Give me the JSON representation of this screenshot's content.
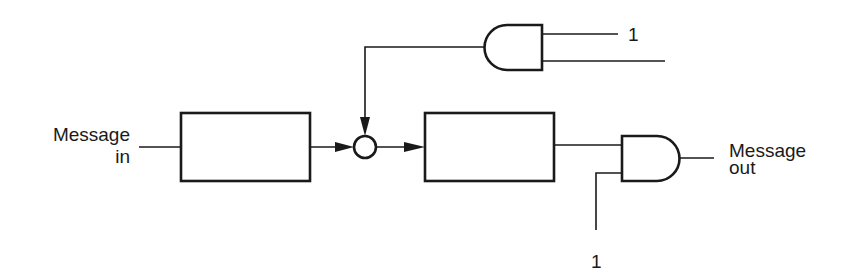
{
  "diagram": {
    "type": "logic-block-diagram",
    "labels": {
      "input_line1": "Message",
      "input_line2": "in",
      "output_line1": "Message",
      "output_line2": "out",
      "top_gate_input_constant": "1",
      "bottom_gate_input_constant": "1"
    },
    "nodes": [
      {
        "id": "block-1",
        "kind": "rectangle",
        "label": ""
      },
      {
        "id": "junction",
        "kind": "circle",
        "label": ""
      },
      {
        "id": "block-2",
        "kind": "rectangle",
        "label": ""
      },
      {
        "id": "and-gate-top",
        "kind": "and-gate",
        "orientation": "output-left"
      },
      {
        "id": "and-gate-output",
        "kind": "and-gate",
        "orientation": "output-right"
      }
    ],
    "edges": [
      {
        "from": "Message in",
        "to": "block-1"
      },
      {
        "from": "block-1",
        "to": "junction",
        "arrow": true
      },
      {
        "from": "junction",
        "to": "block-2",
        "arrow": true
      },
      {
        "from": "and-gate-top",
        "to": "junction",
        "arrow": true
      },
      {
        "from": "1",
        "to": "and-gate-top"
      },
      {
        "from": "unlabeled-input",
        "to": "and-gate-top"
      },
      {
        "from": "block-2",
        "to": "and-gate-output"
      },
      {
        "from": "1",
        "to": "and-gate-output"
      },
      {
        "from": "and-gate-output",
        "to": "Message out"
      }
    ],
    "colors": {
      "ink": "#1a1a1a",
      "background": "#ffffff"
    }
  }
}
